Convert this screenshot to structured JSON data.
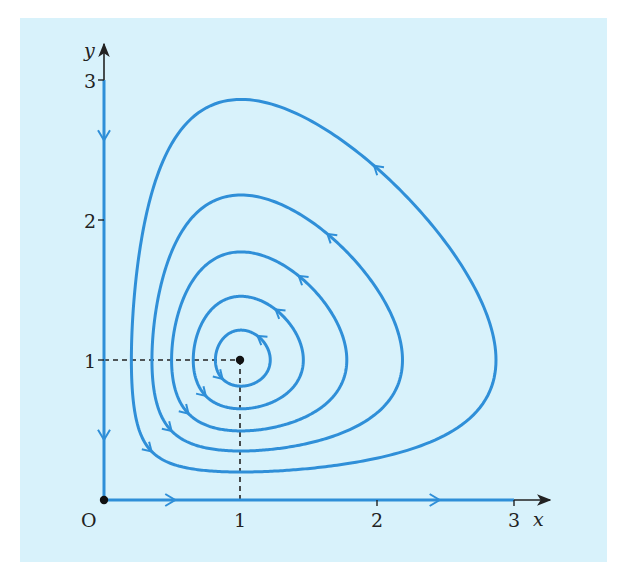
{
  "chart_data": {
    "type": "line",
    "title": "",
    "subtitle": "Phase portrait: closed orbits around equilibrium point (1, 1)",
    "xlabel": "x",
    "ylabel": "y",
    "origin_label": "O",
    "xlim": [
      0,
      3.25
    ],
    "ylim": [
      0,
      3.15
    ],
    "x_ticks": [
      1,
      2,
      3
    ],
    "y_ticks": [
      1,
      2,
      3
    ],
    "x_tick_labels": [
      "1",
      "2",
      "3"
    ],
    "y_tick_labels": [
      "1",
      "2",
      "3"
    ],
    "grid": false,
    "legend": null,
    "equilibrium_points": [
      {
        "x": 0,
        "y": 0,
        "label": "O"
      },
      {
        "x": 1,
        "y": 1
      }
    ],
    "guide_lines": [
      {
        "type": "dashed",
        "from": [
          0,
          1
        ],
        "to": [
          1,
          1
        ]
      },
      {
        "type": "dashed",
        "from": [
          1,
          0
        ],
        "to": [
          1,
          1
        ]
      }
    ],
    "axis_trajectories": [
      {
        "along": "y-axis",
        "direction": "down",
        "arrow_at_y": [
          2.57,
          0.43
        ]
      },
      {
        "along": "x-axis",
        "direction": "right",
        "arrow_at_x": [
          0.52,
          2.45
        ]
      }
    ],
    "orbit_direction": "anticlockwise",
    "series": [
      {
        "name": "orbit-1",
        "level": 1.02,
        "x_crossings_at_y1": [
          0.82,
          1.22
        ]
      },
      {
        "name": "orbit-2",
        "level": 1.08,
        "x_crossings_at_y1": [
          0.66,
          1.47
        ]
      },
      {
        "name": "orbit-3",
        "level": 1.2,
        "x_crossings_at_y1": [
          0.5,
          1.79
        ]
      },
      {
        "name": "orbit-4",
        "level": 1.4,
        "x_crossings_at_y1": [
          0.35,
          2.18
        ]
      },
      {
        "name": "orbit-5",
        "level": 1.81,
        "x_crossings_at_y1": [
          0.2,
          2.84
        ],
        "y_max": 2.85
      }
    ],
    "colors": {
      "background": "#d8f2fb",
      "trajectory": "#2f8fd8",
      "axis": "#222222"
    }
  }
}
